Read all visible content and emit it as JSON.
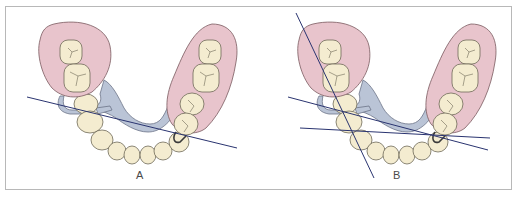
{
  "figure": {
    "panels": [
      {
        "id": "A",
        "label": "A",
        "survey_lines": 1
      },
      {
        "id": "B",
        "label": "B",
        "survey_lines": 3
      }
    ]
  },
  "colors": {
    "saddle_fill": "#e8c4cc",
    "saddle_stroke": "#7a5a60",
    "tooth_fill": "#f4ecd0",
    "tooth_stroke": "#6e6a58",
    "connector_fill": "#bac4d6",
    "connector_stroke": "#6c7488",
    "line_color": "#2a3470",
    "frame_color": "#b8b8b8"
  }
}
